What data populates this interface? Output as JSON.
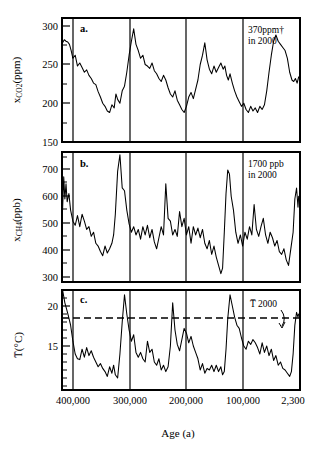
{
  "figure": {
    "xlabel": "Age (a)",
    "x_tick_labels": [
      "400,000",
      "300,000",
      "200,000",
      "100,000",
      "2,300"
    ],
    "x_tick_values": [
      400000,
      300000,
      200000,
      100000,
      2300
    ]
  },
  "panels": {
    "co2": {
      "letter": "a.",
      "ylabel_main": "x",
      "ylabel_sub": "CO",
      "ylabel_sub2": "2",
      "ylabel_unit": "(ppm)",
      "ylabel_full": "x_CO2 (ppm)",
      "y_tick_labels": [
        "150",
        "200",
        "250",
        "300"
      ],
      "annotation_line1": "370ppm†",
      "annotation_line2": "in 2000"
    },
    "ch4": {
      "letter": "b.",
      "ylabel_main": "x",
      "ylabel_sub": "CH",
      "ylabel_sub2": "4",
      "ylabel_unit": "(ppb)",
      "ylabel_full": "x_CH4 (ppb)",
      "y_tick_labels": [
        "300",
        "400",
        "500",
        "600",
        "700"
      ],
      "annotation_line1": "1700 ppb",
      "annotation_line2": "in 2000"
    },
    "temp": {
      "letter": "c.",
      "ylabel_main": "T̅",
      "ylabel_unit": "(°C)",
      "ylabel_full": "T̅ (°C)",
      "y_tick_labels": [
        "15",
        "20"
      ],
      "annotation_line1": "T̅ 2000"
    }
  },
  "chart_data": [
    {
      "type": "line",
      "title": "a.",
      "xlabel": "Age (a)",
      "ylabel": "x_CO2 (ppm)",
      "xlim": [
        415000,
        0
      ],
      "ylim": [
        150,
        310
      ],
      "yticks": [
        150,
        200,
        250,
        300
      ],
      "xticks": [
        400000,
        300000,
        200000,
        100000,
        2300
      ],
      "grid": "vertical-only",
      "legend": "none",
      "annotations": [
        {
          "text": "370ppm† in 2000",
          "x": 60000,
          "y": 298
        }
      ],
      "x": [
        414000,
        411000,
        408000,
        405000,
        402000,
        399000,
        396000,
        392000,
        388000,
        384000,
        380000,
        376000,
        372000,
        368000,
        364000,
        360000,
        356000,
        352000,
        348000,
        344000,
        340000,
        336000,
        332000,
        328000,
        324000,
        321000,
        318000,
        314000,
        310000,
        306000,
        302000,
        298000,
        294000,
        290000,
        286000,
        282000,
        278000,
        274000,
        270000,
        266000,
        262000,
        258000,
        254000,
        250000,
        246000,
        242000,
        238000,
        234000,
        230000,
        226000,
        222000,
        218000,
        214000,
        210000,
        206000,
        202000,
        198000,
        194000,
        190000,
        186000,
        182000,
        178000,
        174000,
        170000,
        166000,
        162000,
        158000,
        154000,
        150000,
        146000,
        142000,
        138000,
        134000,
        131000,
        128000,
        125000,
        122000,
        118000,
        114000,
        110000,
        106000,
        102000,
        98000,
        94000,
        90000,
        86000,
        82000,
        78000,
        74000,
        70000,
        66000,
        62000,
        58000,
        54000,
        50000,
        46000,
        42000,
        38000,
        34000,
        30000,
        26000,
        22000,
        18000,
        14000,
        11000,
        8000,
        5000,
        2300
      ],
      "values": [
        278,
        282,
        280,
        279,
        276,
        268,
        258,
        262,
        248,
        252,
        246,
        240,
        243,
        236,
        232,
        226,
        224,
        215,
        208,
        200,
        196,
        190,
        188,
        198,
        194,
        212,
        205,
        200,
        216,
        222,
        240,
        262,
        280,
        296,
        276,
        268,
        258,
        262,
        250,
        248,
        245,
        252,
        242,
        238,
        232,
        228,
        236,
        230,
        220,
        212,
        208,
        216,
        204,
        198,
        192,
        188,
        196,
        208,
        214,
        206,
        218,
        230,
        250,
        262,
        278,
        256,
        244,
        238,
        248,
        240,
        246,
        252,
        244,
        248,
        236,
        230,
        238,
        226,
        216,
        208,
        202,
        196,
        200,
        192,
        188,
        196,
        190,
        194,
        188,
        196,
        192,
        198,
        216,
        240,
        262,
        280,
        288,
        280,
        276,
        272,
        268,
        258,
        240,
        230,
        228,
        232,
        226,
        234
      ]
    },
    {
      "type": "line",
      "title": "b.",
      "xlabel": "Age (a)",
      "ylabel": "x_CH4 (ppb)",
      "xlim": [
        415000,
        0
      ],
      "ylim": [
        300,
        770
      ],
      "yticks": [
        300,
        400,
        500,
        600,
        700
      ],
      "xticks": [
        400000,
        300000,
        200000,
        100000,
        2300
      ],
      "grid": "vertical-only",
      "legend": "none",
      "annotations": [
        {
          "text": "1700 ppb in 2000",
          "x": 60000,
          "y": 745
        }
      ],
      "x": [
        414000,
        412000,
        410000,
        408000,
        406000,
        403000,
        400000,
        396000,
        392000,
        388000,
        384000,
        380000,
        376000,
        372000,
        368000,
        364000,
        360000,
        356000,
        352000,
        348000,
        344000,
        340000,
        336000,
        332000,
        328000,
        325000,
        322000,
        318000,
        314000,
        310000,
        306000,
        302000,
        298000,
        294000,
        290000,
        286000,
        282000,
        278000,
        274000,
        270000,
        266000,
        262000,
        258000,
        254000,
        250000,
        246000,
        242000,
        238000,
        234000,
        230000,
        226000,
        222000,
        218000,
        214000,
        210000,
        206000,
        202000,
        198000,
        194000,
        190000,
        186000,
        182000,
        178000,
        174000,
        170000,
        166000,
        162000,
        158000,
        154000,
        150000,
        146000,
        142000,
        138000,
        135000,
        132000,
        129000,
        126000,
        123000,
        120000,
        116000,
        112000,
        108000,
        104000,
        100000,
        96000,
        92000,
        88000,
        84000,
        80000,
        76000,
        72000,
        68000,
        64000,
        60000,
        56000,
        52000,
        48000,
        44000,
        40000,
        36000,
        32000,
        28000,
        24000,
        20000,
        16000,
        12000,
        9000,
        6000,
        3500,
        2300
      ],
      "values": [
        560,
        680,
        600,
        655,
        590,
        620,
        560,
        520,
        505,
        540,
        500,
        545,
        520,
        490,
        500,
        465,
        480,
        440,
        430,
        410,
        395,
        430,
        405,
        420,
        440,
        470,
        545,
        700,
        760,
        640,
        630,
        560,
        510,
        480,
        500,
        470,
        490,
        455,
        500,
        470,
        505,
        460,
        490,
        445,
        420,
        460,
        500,
        470,
        655,
        530,
        520,
        470,
        490,
        465,
        555,
        500,
        530,
        470,
        500,
        440,
        500,
        470,
        495,
        460,
        490,
        440,
        420,
        450,
        400,
        430,
        390,
        360,
        330,
        350,
        480,
        620,
        705,
        690,
        610,
        560,
        480,
        440,
        470,
        430,
        480,
        455,
        500,
        470,
        580,
        490,
        465,
        500,
        530,
        470,
        440,
        480,
        460,
        430,
        450,
        410,
        400,
        420,
        380,
        360,
        420,
        480,
        600,
        640,
        570,
        610
      ]
    },
    {
      "type": "line",
      "title": "c.",
      "xlabel": "Age (a)",
      "ylabel": "T̅ (°C)",
      "xlim": [
        415000,
        0
      ],
      "ylim": [
        11.5,
        24
      ],
      "yticks": [
        15,
        20
      ],
      "xticks": [
        400000,
        300000,
        200000,
        100000,
        2300
      ],
      "grid": "vertical-only",
      "legend": "none",
      "reference_line": {
        "label": "T̅ 2000",
        "value": 20.5,
        "style": "dashed"
      },
      "annotations": [
        {
          "text": "T̅ 2000",
          "x": 70000,
          "y": 22.3
        }
      ],
      "x": [
        414000,
        412000,
        410000,
        407000,
        404000,
        400000,
        396000,
        392000,
        388000,
        384000,
        380000,
        376000,
        372000,
        368000,
        364000,
        360000,
        356000,
        352000,
        348000,
        344000,
        340000,
        336000,
        332000,
        328000,
        325000,
        322000,
        318000,
        314000,
        310000,
        306000,
        302000,
        298000,
        294000,
        290000,
        286000,
        282000,
        278000,
        274000,
        270000,
        266000,
        262000,
        258000,
        254000,
        250000,
        246000,
        242000,
        238000,
        234000,
        230000,
        226000,
        222000,
        218000,
        214000,
        210000,
        206000,
        202000,
        198000,
        194000,
        190000,
        186000,
        182000,
        178000,
        174000,
        170000,
        166000,
        162000,
        158000,
        154000,
        150000,
        146000,
        142000,
        138000,
        135000,
        132000,
        129000,
        126000,
        122000,
        118000,
        114000,
        110000,
        106000,
        102000,
        98000,
        94000,
        90000,
        86000,
        82000,
        78000,
        74000,
        70000,
        66000,
        62000,
        58000,
        54000,
        50000,
        46000,
        42000,
        38000,
        34000,
        30000,
        26000,
        22000,
        18000,
        15000,
        12000,
        9000,
        6000,
        3500,
        2300
      ],
      "values": [
        24.0,
        23.2,
        22.4,
        21.6,
        20.8,
        19.6,
        17.6,
        16.0,
        15.4,
        15.3,
        16.6,
        15.6,
        16.8,
        15.8,
        16.4,
        15.6,
        15.0,
        14.4,
        14.8,
        14.2,
        13.8,
        13.2,
        14.4,
        13.6,
        14.6,
        13.4,
        13.0,
        16.0,
        20.0,
        23.4,
        21.0,
        19.0,
        17.6,
        18.4,
        16.2,
        15.6,
        16.2,
        15.4,
        15.0,
        17.6,
        16.2,
        16.6,
        15.0,
        14.6,
        15.4,
        14.0,
        14.6,
        13.8,
        14.4,
        17.0,
        22.4,
        19.0,
        17.2,
        16.4,
        17.8,
        19.2,
        18.6,
        17.4,
        18.2,
        17.0,
        16.2,
        15.4,
        14.0,
        14.8,
        13.6,
        14.2,
        14.0,
        14.6,
        13.8,
        14.6,
        13.8,
        14.4,
        13.4,
        13.8,
        16.6,
        20.4,
        23.4,
        22.0,
        20.6,
        19.6,
        19.2,
        18.0,
        17.0,
        16.6,
        17.6,
        17.2,
        17.8,
        17.4,
        16.8,
        16.0,
        17.4,
        16.2,
        17.0,
        15.8,
        16.6,
        15.2,
        15.8,
        14.6,
        15.0,
        14.2,
        14.0,
        13.6,
        13.2,
        13.8,
        16.0,
        19.6,
        21.2,
        20.6,
        21.0
      ]
    }
  ]
}
